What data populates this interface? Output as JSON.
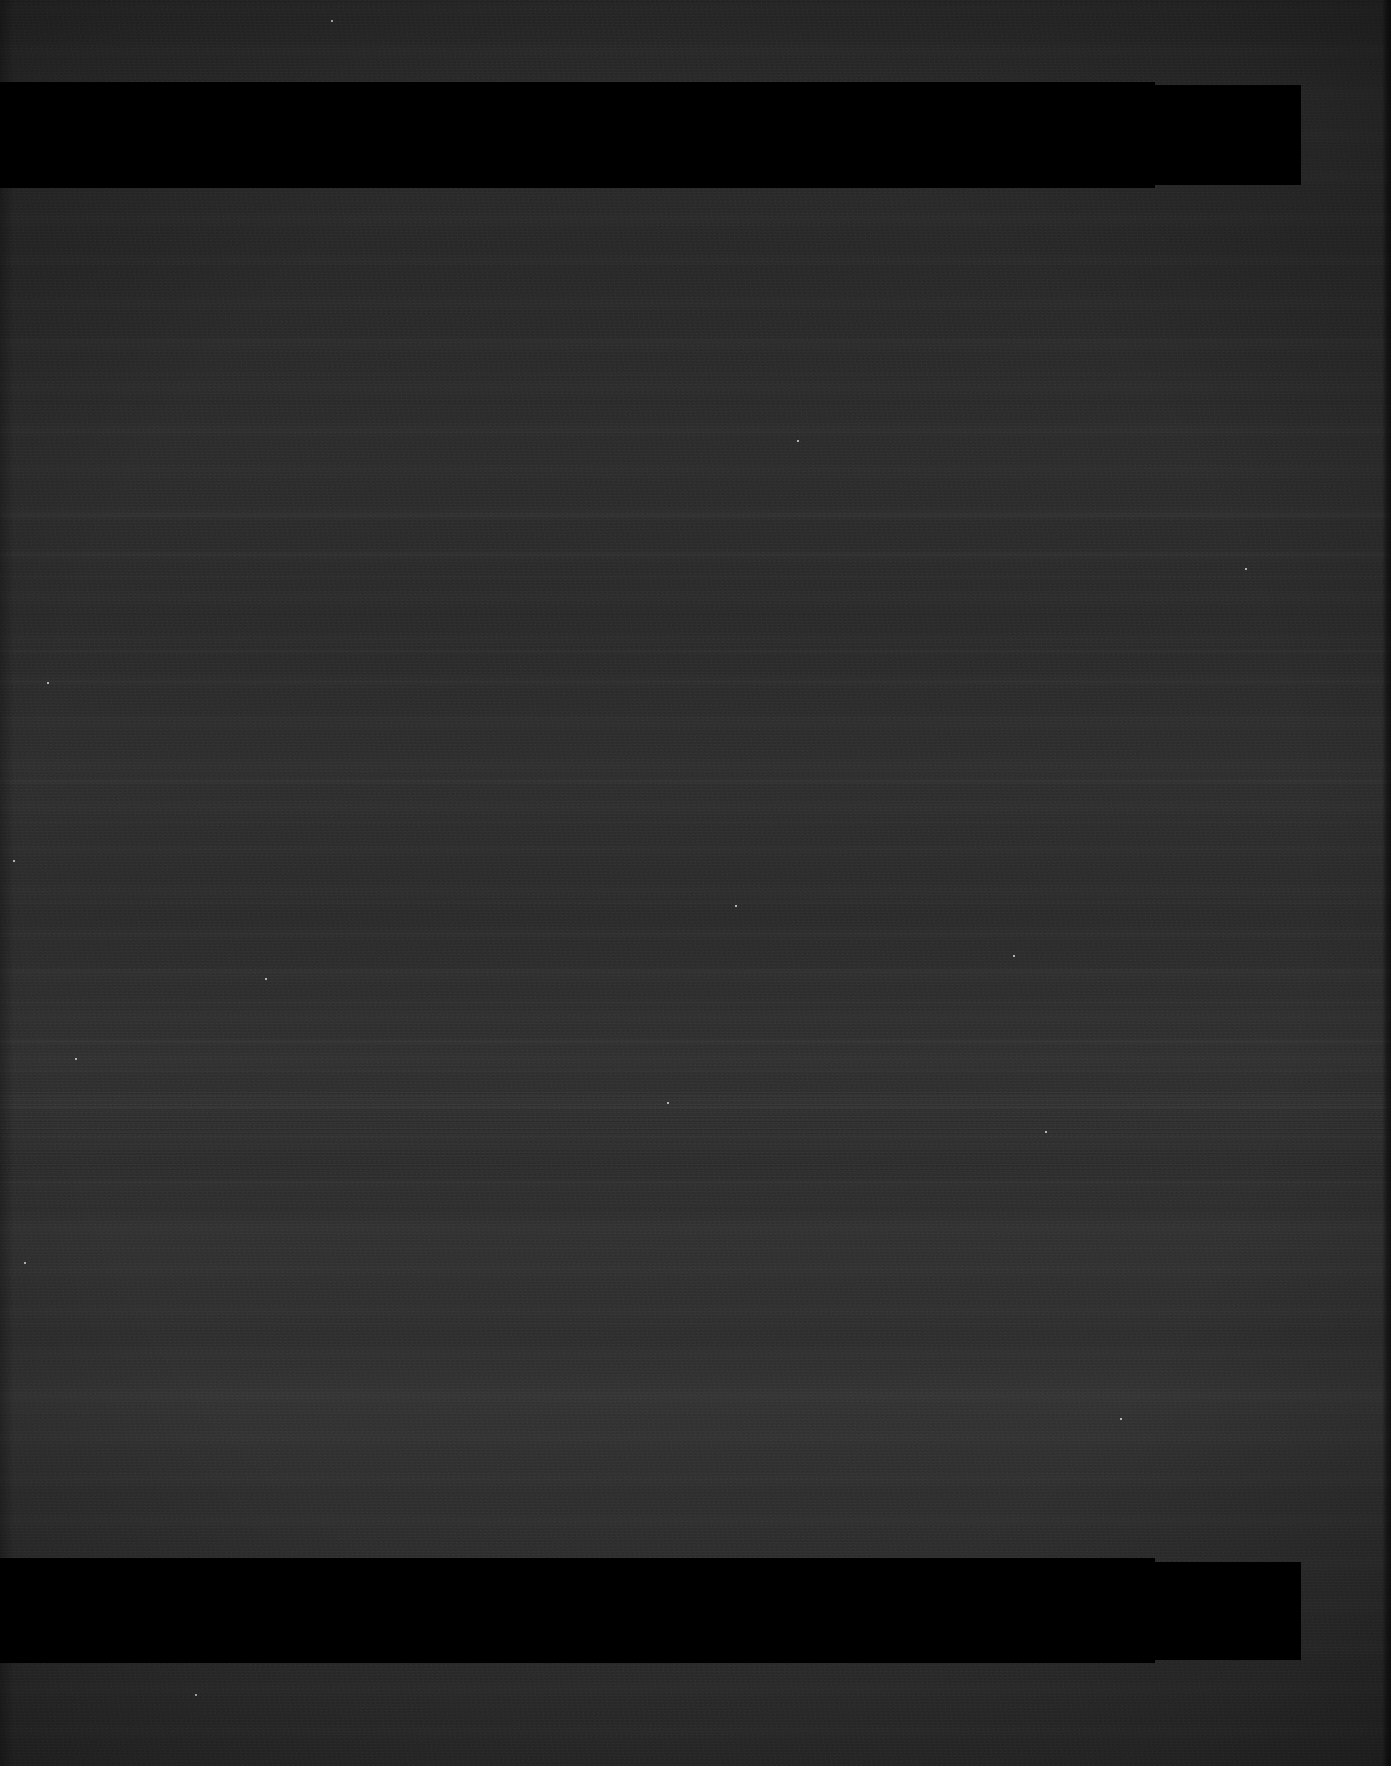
{
  "image": {
    "kind": "underexposed-photographic-scan",
    "width": 1391,
    "height": 1766,
    "description": "Severely underexposed dark frame showing sensor readout banding and two solid black redaction bars",
    "alt_text": "Near-black image with horizontal noise striations and two full-width black bars",
    "base_color": "#2a2a2a",
    "bar_color": "#000000",
    "edge_shadow_color": "#1a1a1a",
    "noise_highlight_color": "#3a3a3a"
  },
  "regions": [
    {
      "name": "top-margin-strip",
      "y": 0,
      "height": 82,
      "label": "Top noise margin"
    },
    {
      "name": "upper-redaction-bar",
      "y": 82,
      "height": 106,
      "label": "Upper black bar"
    },
    {
      "name": "main-noise-field",
      "y": 188,
      "height": 1370,
      "label": "Main banded noise field"
    },
    {
      "name": "lower-redaction-bar",
      "y": 1558,
      "height": 105,
      "label": "Lower black bar"
    },
    {
      "name": "bottom-margin-strip",
      "y": 1663,
      "height": 103,
      "label": "Bottom noise margin"
    }
  ],
  "black_bars": [
    {
      "name": "upper-redaction-bar",
      "x": 0,
      "y": 82,
      "width": 1155,
      "height": 106
    },
    {
      "name": "upper-redaction-bar-extension",
      "x": 0,
      "y": 85,
      "width": 1301,
      "height": 100
    },
    {
      "name": "lower-redaction-bar",
      "x": 0,
      "y": 1558,
      "width": 1155,
      "height": 105
    },
    {
      "name": "lower-redaction-bar-extension",
      "x": 0,
      "y": 1562,
      "width": 1301,
      "height": 98
    }
  ],
  "bright_streaks": [
    {
      "y": 338,
      "height": 5,
      "intensity": 0.3
    },
    {
      "y": 372,
      "height": 4,
      "intensity": 0.24
    },
    {
      "y": 430,
      "height": 4,
      "intensity": 0.22
    },
    {
      "y": 512,
      "height": 7,
      "intensity": 0.42
    },
    {
      "y": 552,
      "height": 5,
      "intensity": 0.34
    },
    {
      "y": 575,
      "height": 4,
      "intensity": 0.26
    },
    {
      "y": 648,
      "height": 6,
      "intensity": 0.38
    },
    {
      "y": 680,
      "height": 4,
      "intensity": 0.22
    },
    {
      "y": 716,
      "height": 4,
      "intensity": 0.2
    },
    {
      "y": 778,
      "height": 7,
      "intensity": 0.46
    },
    {
      "y": 820,
      "height": 4,
      "intensity": 0.24
    },
    {
      "y": 900,
      "height": 5,
      "intensity": 0.3
    },
    {
      "y": 932,
      "height": 4,
      "intensity": 0.24
    },
    {
      "y": 968,
      "height": 6,
      "intensity": 0.36
    },
    {
      "y": 1000,
      "height": 5,
      "intensity": 0.3
    },
    {
      "y": 1038,
      "height": 7,
      "intensity": 0.44
    },
    {
      "y": 1068,
      "height": 5,
      "intensity": 0.32
    },
    {
      "y": 1104,
      "height": 6,
      "intensity": 0.38
    },
    {
      "y": 1134,
      "height": 5,
      "intensity": 0.3
    },
    {
      "y": 1180,
      "height": 4,
      "intensity": 0.5
    },
    {
      "y": 1246,
      "height": 4,
      "intensity": 0.2
    },
    {
      "y": 1322,
      "height": 4,
      "intensity": 0.18
    },
    {
      "y": 1410,
      "height": 4,
      "intensity": 0.16
    },
    {
      "y": 1704,
      "height": 4,
      "intensity": 0.14
    }
  ],
  "dark_troughs": [
    {
      "y": 264,
      "height": 6,
      "intensity": 0.2
    },
    {
      "y": 400,
      "height": 5,
      "intensity": 0.16
    },
    {
      "y": 470,
      "height": 5,
      "intensity": 0.14
    },
    {
      "y": 612,
      "height": 5,
      "intensity": 0.18
    },
    {
      "y": 842,
      "height": 5,
      "intensity": 0.16
    },
    {
      "y": 1205,
      "height": 8,
      "intensity": 0.22
    },
    {
      "y": 1490,
      "height": 6,
      "intensity": 0.14
    }
  ],
  "dense_zones": [
    {
      "name": "dense-striation-cluster-a",
      "y": 1092,
      "height": 48,
      "opacity": 0.75
    },
    {
      "name": "dense-striation-cluster-b",
      "y": 1144,
      "height": 34,
      "opacity": 0.55
    }
  ],
  "hot_pixels": [
    {
      "x": 47,
      "y": 682
    },
    {
      "x": 265,
      "y": 978
    },
    {
      "x": 667,
      "y": 1102
    },
    {
      "x": 735,
      "y": 905
    },
    {
      "x": 1013,
      "y": 955
    },
    {
      "x": 1045,
      "y": 1131
    },
    {
      "x": 1245,
      "y": 568
    },
    {
      "x": 75,
      "y": 1058
    },
    {
      "x": 13,
      "y": 860
    },
    {
      "x": 331,
      "y": 20
    },
    {
      "x": 1120,
      "y": 1418
    },
    {
      "x": 195,
      "y": 1694
    },
    {
      "x": 487,
      "y": 1616
    },
    {
      "x": 24,
      "y": 1262
    },
    {
      "x": 797,
      "y": 440
    }
  ],
  "edges": {
    "right_strip_x": 1382,
    "right_strip_width": 9,
    "left_strip_width": 14
  }
}
